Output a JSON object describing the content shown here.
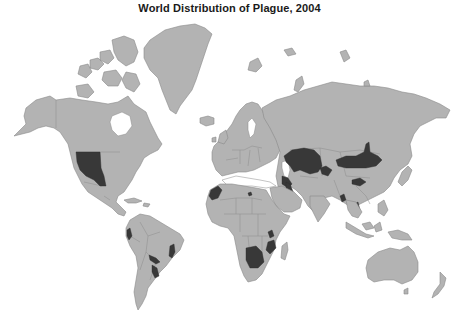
{
  "title": "World Distribution of Plague, 2004",
  "map": {
    "projection": "mercator",
    "colors": {
      "background": "#ffffff",
      "land": "#b3b3b3",
      "border": "#8a8a8a",
      "plague_area": "#383838"
    },
    "legend": null,
    "regions": [
      {
        "name": "North America",
        "plague_areas": [
          "Western United States"
        ]
      },
      {
        "name": "South America",
        "plague_areas": [
          "Peru/Ecuador coast",
          "Bolivia",
          "Northeastern Brazil",
          "Southern Brazil/Paraguay"
        ]
      },
      {
        "name": "Africa",
        "plague_areas": [
          "Morocco/Western Sahara",
          "Libya",
          "Tanzania/Malawi",
          "Mozambique/Zimbabwe",
          "Namibia/Botswana/South Africa"
        ]
      },
      {
        "name": "Middle East",
        "plague_areas": [
          "Caucasus/Iran",
          "Saudi Arabia",
          "Iraq"
        ]
      },
      {
        "name": "Asia",
        "plague_areas": [
          "Kazakhstan/Central Asia",
          "Mongolia",
          "Western China",
          "Northern China",
          "India",
          "Myanmar",
          "Vietnam"
        ]
      },
      {
        "name": "Europe",
        "plague_areas": []
      },
      {
        "name": "Oceania",
        "plague_areas": []
      }
    ]
  }
}
